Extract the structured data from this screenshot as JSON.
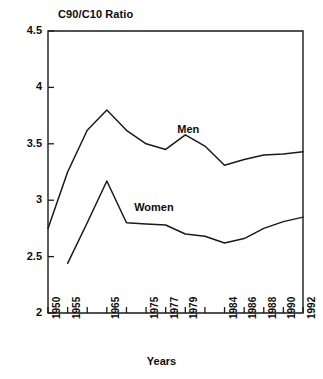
{
  "chart_data": {
    "type": "line",
    "title": "C90/C10 Ratio",
    "xlabel": "Years",
    "ylabel": "",
    "ylim": [
      2,
      4.5
    ],
    "yticks": [
      2,
      2.5,
      3,
      3.5,
      4,
      4.5
    ],
    "ytick_labels": [
      "2",
      "2.5",
      "3",
      "3.5",
      "4",
      "4.5"
    ],
    "grid": false,
    "legend_position": "inline-annotation",
    "x": [
      1950,
      1955,
      1960,
      1965,
      1970,
      1975,
      1977,
      1979,
      1981,
      1984,
      1986,
      1988,
      1990,
      1992
    ],
    "xticks": [
      1950,
      1955,
      1960,
      1965,
      1970,
      1975,
      1977,
      1979,
      1981,
      1984,
      1986,
      1988,
      1990,
      1992
    ],
    "xtick_labels": [
      "1950",
      "1955",
      "",
      "1965",
      "",
      "1975",
      "1977",
      "1979",
      "",
      "1984",
      "1986",
      "1988",
      "1990",
      "1992"
    ],
    "xtick_labels_visible": [
      "1950",
      "1955",
      "1965",
      "1975",
      "1977",
      "1979",
      "1984",
      "1986",
      "1988",
      "1990",
      "1992"
    ],
    "series": [
      {
        "name": "Men",
        "color": "#1a1a1a",
        "x": [
          1950,
          1955,
          1960,
          1965,
          1970,
          1975,
          1977,
          1979,
          1981,
          1984,
          1986,
          1988,
          1990,
          1992
        ],
        "values": [
          2.75,
          3.25,
          3.62,
          3.8,
          3.62,
          3.5,
          3.45,
          3.58,
          3.48,
          3.31,
          3.36,
          3.4,
          3.41,
          3.43
        ]
      },
      {
        "name": "Women",
        "color": "#1a1a1a",
        "x": [
          1955,
          1960,
          1965,
          1970,
          1975,
          1977,
          1979,
          1981,
          1984,
          1986,
          1988,
          1990,
          1992
        ],
        "values": [
          2.44,
          2.8,
          3.17,
          2.8,
          2.79,
          2.78,
          2.7,
          2.68,
          2.62,
          2.66,
          2.75,
          2.81,
          2.85
        ]
      }
    ],
    "annotations": [
      {
        "text": "Men",
        "x": 1979,
        "y": 3.62
      },
      {
        "text": "Women",
        "x": 1974,
        "y": 2.93
      }
    ]
  },
  "axes": {
    "plot_left_px": 48,
    "plot_right_px": 303,
    "plot_top_px": 31,
    "plot_bottom_px": 313
  }
}
